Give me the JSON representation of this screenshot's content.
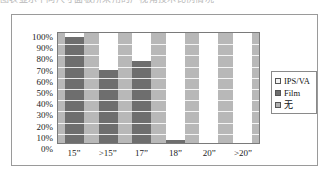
{
  "top_text": {
    "content": "图表显示不同尺寸面板所采用的广视角技术比例情况"
  },
  "legend": {
    "position": "right",
    "entries": [
      {
        "label": "IPS/VA",
        "color": "#ffffff",
        "key": "ips_va"
      },
      {
        "label": "Film",
        "color": "#6e6e6e",
        "key": "film"
      },
      {
        "label": "无",
        "color": "#b0b0b0",
        "key": "none"
      }
    ]
  },
  "y_axis": {
    "ticks": [
      "100%",
      "90%",
      "80%",
      "70%",
      "60%",
      "50%",
      "40%",
      "30%",
      "20%",
      "10%",
      "0%"
    ],
    "min": 0,
    "max": 100
  },
  "x_axis": {
    "ticks": [
      "15”",
      ">15”",
      "17”",
      "18”",
      "20”",
      ">20”"
    ]
  },
  "chart_data": {
    "type": "bar",
    "subtype": "100% stacked column",
    "title": "",
    "subtitle": "",
    "xlabel": "",
    "ylabel": "",
    "ylim": [
      0,
      100
    ],
    "ytick_labels": [
      "0%",
      "10%",
      "20%",
      "30%",
      "40%",
      "50%",
      "60%",
      "70%",
      "80%",
      "90%",
      "100%"
    ],
    "ytick_interval": 10,
    "grid": true,
    "grid_axis": "y",
    "legend_position": "right",
    "categories": [
      "15”",
      ">15”",
      "17”",
      "18”",
      "20”",
      ">20”"
    ],
    "series": [
      {
        "name": "Film",
        "color": "#6e6e6e",
        "values": [
          96,
          66,
          75,
          3,
          0,
          0
        ]
      },
      {
        "name": "IPS/VA",
        "color": "#ffffff",
        "values": [
          4,
          34,
          25,
          97,
          100,
          100
        ]
      },
      {
        "name": "无",
        "color": "#b0b0b0",
        "values": [
          0,
          0,
          0,
          0,
          0,
          0
        ]
      }
    ],
    "stack_order_bottom_to_top": [
      "Film",
      "IPS/VA"
    ],
    "units": "percent"
  },
  "bars": [
    {
      "category": "15”",
      "film": 96,
      "ips_va": 4,
      "none": 0
    },
    {
      "category": ">15”",
      "film": 66,
      "ips_va": 34,
      "none": 0
    },
    {
      "category": "17”",
      "film": 75,
      "ips_va": 25,
      "none": 0
    },
    {
      "category": "18”",
      "film": 3,
      "ips_va": 97,
      "none": 0
    },
    {
      "category": "20”",
      "film": 0,
      "ips_va": 100,
      "none": 0
    },
    {
      "category": ">20”",
      "film": 0,
      "ips_va": 100,
      "none": 0
    }
  ],
  "colors": {
    "plot_background": "#b8b8b8",
    "gridline": "#ffffff",
    "frame_border": "#9a9a9a",
    "plot_border": "#7a7a7a",
    "text": "#1b1b1b"
  }
}
